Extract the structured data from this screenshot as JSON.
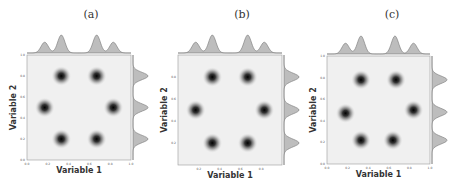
{
  "chart_data": [
    {
      "type": "heatmap",
      "panel_label": "(a)",
      "title": "",
      "xlabel": "Variable 1",
      "ylabel": "Variable 2",
      "xlim": [
        0.0,
        1.0
      ],
      "ylim": [
        0.0,
        1.0
      ],
      "xticks": [
        "0.0",
        "0.2",
        "0.4",
        "0.6",
        "0.8",
        "1.0"
      ],
      "yticks": [
        "0.0",
        "0.2",
        "0.4",
        "0.6",
        "0.8",
        "1.0"
      ],
      "grid": false,
      "description": "2D Gaussian mixture density with 6 modes arranged in a hexagon; marginal KDEs on top and right",
      "modes": [
        {
          "x": 0.33,
          "y": 0.8
        },
        {
          "x": 0.67,
          "y": 0.8
        },
        {
          "x": 0.17,
          "y": 0.5
        },
        {
          "x": 0.83,
          "y": 0.5
        },
        {
          "x": 0.33,
          "y": 0.2
        },
        {
          "x": 0.67,
          "y": 0.2
        }
      ],
      "marginal_x_peaks": [
        0.17,
        0.33,
        0.67,
        0.83
      ],
      "marginal_y_peaks": [
        0.2,
        0.5,
        0.8
      ]
    },
    {
      "type": "heatmap",
      "panel_label": "(b)",
      "title": "",
      "xlabel": "Variable 1",
      "ylabel": "Variable 2",
      "xlim": [
        0.0,
        1.0
      ],
      "ylim": [
        0.0,
        1.0
      ],
      "xticks": [
        "0.2",
        "0.4",
        "0.6",
        "0.8"
      ],
      "yticks": [
        "0.2",
        "0.4",
        "0.6",
        "0.8"
      ],
      "grid": false,
      "description": "2D Gaussian mixture density with 6 modes arranged in a hexagon; marginal KDEs on top and right",
      "modes": [
        {
          "x": 0.33,
          "y": 0.8
        },
        {
          "x": 0.67,
          "y": 0.8
        },
        {
          "x": 0.17,
          "y": 0.5
        },
        {
          "x": 0.83,
          "y": 0.5
        },
        {
          "x": 0.33,
          "y": 0.2
        },
        {
          "x": 0.67,
          "y": 0.2
        }
      ],
      "marginal_x_peaks": [
        0.17,
        0.33,
        0.67,
        0.83
      ],
      "marginal_y_peaks": [
        0.2,
        0.5,
        0.8
      ]
    },
    {
      "type": "heatmap",
      "panel_label": "(c)",
      "title": "",
      "xlabel": "Variable 1",
      "ylabel": "Variable 2",
      "xlim": [
        0.0,
        1.0
      ],
      "ylim": [
        0.0,
        1.0
      ],
      "xticks": [
        "0.0",
        "0.2",
        "0.4",
        "0.6",
        "0.8",
        "1.0"
      ],
      "yticks": [
        "0.0",
        "0.2",
        "0.4",
        "0.6",
        "0.8",
        "1.0"
      ],
      "grid": false,
      "description": "2D Gaussian mixture density with 6 modes arranged in a hexagon (slightly perturbed); marginal KDEs on top and right",
      "modes": [
        {
          "x": 0.33,
          "y": 0.78
        },
        {
          "x": 0.67,
          "y": 0.78
        },
        {
          "x": 0.18,
          "y": 0.47
        },
        {
          "x": 0.84,
          "y": 0.5
        },
        {
          "x": 0.33,
          "y": 0.22
        },
        {
          "x": 0.64,
          "y": 0.22
        }
      ],
      "marginal_x_peaks": [
        0.18,
        0.33,
        0.66,
        0.84
      ],
      "marginal_y_peaks": [
        0.22,
        0.48,
        0.78
      ]
    }
  ],
  "panels": [
    {
      "label": "(a)",
      "xlabel": "Variable 1",
      "ylabel": "Variable 2"
    },
    {
      "label": "(b)",
      "xlabel": "Variable 1",
      "ylabel": "Variable 2"
    },
    {
      "label": "(c)",
      "xlabel": "Variable 1",
      "ylabel": "Variable 2"
    }
  ]
}
